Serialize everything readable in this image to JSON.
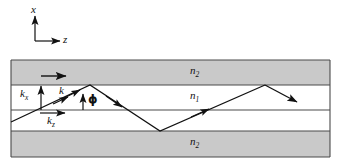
{
  "figure": {
    "background_color": "#ffffff",
    "line_color": "#111111",
    "cladding_fill": "#c9c9c9",
    "core_fill": "#ffffff"
  },
  "axes": {
    "x_label": "x",
    "z_label": "z",
    "origin": {
      "x": 35,
      "y": 41
    },
    "x_arrow_length": 27,
    "z_arrow_length": 29
  },
  "layers": [
    {
      "name": "cladding-top",
      "index_label": "n",
      "index_sub": "2",
      "fill": "#c9c9c9",
      "y_top": 60,
      "y_bottom": 85
    },
    {
      "name": "core-upper",
      "index_label": "n",
      "index_sub": "1",
      "fill": "#ffffff",
      "y_top": 85,
      "y_bottom": 110
    },
    {
      "name": "core-lower",
      "index_label": "",
      "index_sub": "",
      "fill": "#ffffff",
      "y_top": 110,
      "y_bottom": 131
    },
    {
      "name": "cladding-bottom",
      "index_label": "n",
      "index_sub": "2",
      "fill": "#c9c9c9",
      "y_top": 131,
      "y_bottom": 157
    }
  ],
  "labels": {
    "n2_top": {
      "base": "n",
      "sub": "2"
    },
    "n1_core": {
      "base": "n",
      "sub": "1"
    },
    "n2_bottom": {
      "base": "n",
      "sub": "2"
    },
    "k_vector": {
      "base": "k",
      "sub": ""
    },
    "kx_component": {
      "base": "k",
      "sub": "x"
    },
    "kz_component": {
      "base": "k",
      "sub": "z"
    },
    "phi_angle": "ϕ"
  },
  "ray_path": {
    "type": "zigzag-total-internal-reflection",
    "points": [
      {
        "x": 11,
        "y": 122
      },
      {
        "x": 90,
        "y": 85
      },
      {
        "x": 160,
        "y": 131
      },
      {
        "x": 265,
        "y": 85
      }
    ],
    "exit_arrow": {
      "from": {
        "x": 265,
        "y": 85
      },
      "to": {
        "x": 300,
        "y": 104
      }
    },
    "direction_arrow_count": 3
  },
  "annotations": {
    "kz_arrow": {
      "from": {
        "x": 40,
        "y": 113
      },
      "to": {
        "x": 66,
        "y": 113
      }
    },
    "kx_arrow": {
      "from": {
        "x": 41,
        "y": 110
      },
      "to": {
        "x": 41,
        "y": 85
      }
    },
    "phi_arrow": {
      "from": {
        "x": 83,
        "y": 110
      },
      "to": {
        "x": 83,
        "y": 93
      }
    },
    "top_arrow": {
      "from": {
        "x": 41,
        "y": 76
      },
      "to": {
        "x": 67,
        "y": 76
      }
    }
  }
}
